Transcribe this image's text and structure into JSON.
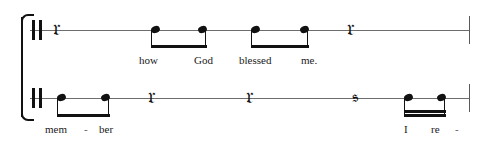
{
  "score": {
    "title": "",
    "staff_type": "single-line rhythm staff",
    "systems": [
      {
        "id": "system-1",
        "clef_area": {
          "barline": "double-thick-barline"
        },
        "events": [
          {
            "type": "rest",
            "value": "quarter",
            "glyph": "quarter-rest"
          },
          {
            "type": "note",
            "value": "eighth",
            "beamed": true,
            "beam_group": 1,
            "lyric": "how"
          },
          {
            "type": "note",
            "value": "eighth",
            "beamed": true,
            "beam_group": 1,
            "lyric": "God"
          },
          {
            "type": "note",
            "value": "eighth",
            "beamed": true,
            "beam_group": 2,
            "lyric": "blessed"
          },
          {
            "type": "note",
            "value": "eighth",
            "beamed": true,
            "beam_group": 2,
            "lyric": "me."
          },
          {
            "type": "rest",
            "value": "quarter",
            "glyph": "quarter-rest"
          }
        ],
        "lyrics": [
          "how",
          "God",
          "blessed",
          "me."
        ],
        "end_barline": "thin-barline"
      },
      {
        "id": "system-2",
        "clef_area": {
          "barline": "double-thick-barline"
        },
        "events": [
          {
            "type": "note",
            "value": "eighth",
            "beamed": true,
            "beam_group": 1,
            "lyric": "mem"
          },
          {
            "type": "note",
            "value": "eighth",
            "beamed": true,
            "beam_group": 1,
            "lyric": "ber"
          },
          {
            "type": "rest",
            "value": "quarter",
            "glyph": "quarter-rest"
          },
          {
            "type": "rest",
            "value": "quarter",
            "glyph": "quarter-rest"
          },
          {
            "type": "rest",
            "value": "eighth",
            "glyph": "eighth-rest"
          },
          {
            "type": "note",
            "value": "sixteenth",
            "beamed": true,
            "beam_group": 2,
            "lyric": "I"
          },
          {
            "type": "note",
            "value": "sixteenth",
            "beamed": true,
            "beam_group": 2,
            "lyric": "re"
          }
        ],
        "lyrics": [
          "mem",
          "ber",
          "I",
          "re"
        ],
        "hyphens": [
          "-",
          "-"
        ],
        "end_barline": "thin-barline"
      }
    ],
    "glyphs": {
      "quarter_rest": "❣",
      "eighth_rest": "♩"
    },
    "colors": {
      "ink": "#111111",
      "staff_line": "#6d6d6d",
      "lyric_text": "#1a1a1a",
      "background": "#ffffff"
    }
  }
}
